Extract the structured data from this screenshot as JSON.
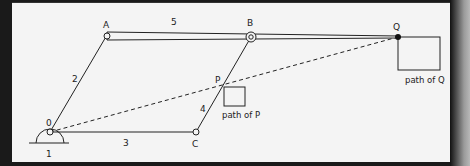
{
  "diagram": {
    "type": "mechanism linkage (pantograph)",
    "colors": {
      "background": "#f4f4f4",
      "frame": "#1a1a1a",
      "line": "#222222"
    },
    "points": {
      "O": {
        "label": "0",
        "x": 50,
        "y": 132
      },
      "A": {
        "label": "A",
        "x": 107,
        "y": 35
      },
      "B": {
        "label": "B",
        "x": 251,
        "y": 37
      },
      "Q": {
        "label": "Q",
        "x": 398,
        "y": 37
      },
      "C": {
        "label": "C",
        "x": 196,
        "y": 132
      },
      "P": {
        "label": "P",
        "x": 224,
        "y": 96
      }
    },
    "links": [
      {
        "label": "1",
        "description": "ground"
      },
      {
        "label": "2",
        "from": "O",
        "to": "A"
      },
      {
        "label": "3",
        "from": "O",
        "to": "C"
      },
      {
        "label": "4",
        "from": "C",
        "to": "B"
      },
      {
        "label": "5",
        "from": "A",
        "to": "Q"
      }
    ],
    "captions": {
      "path_of_p": "path of P",
      "path_of_q": "path of Q"
    }
  }
}
